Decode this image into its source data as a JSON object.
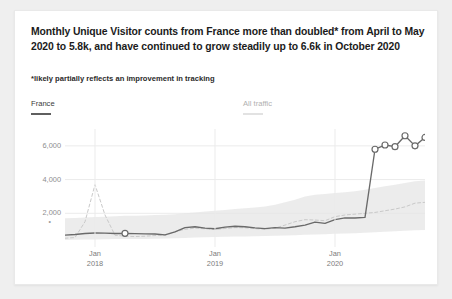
{
  "headline": "Monthly Unique Visitor counts from France more than doubled* from April to May 2020 to 5.8k, and have continued to grow steadily up to 6.6k in October 2020",
  "footnote": "*likely partially reflects an improvement in tracking",
  "legend": {
    "france": "France",
    "all_traffic": "All traffic"
  },
  "colors": {
    "france_line": "#6a6a6a",
    "all_traffic_line": "#c9c9c9",
    "band": "#e6e6e6",
    "grid": "#ebebeb",
    "marker_fill": "#ffffff",
    "card": "#ffffff",
    "page": "#efefef"
  },
  "chart_data": {
    "type": "line",
    "title": "",
    "xlabel": "",
    "ylabel": "",
    "ylim": [
      0,
      7000
    ],
    "grid": true,
    "legend_position": "top",
    "y_ticks": [
      "2,000",
      "4,000",
      "6,000"
    ],
    "y_tick_values": [
      2000,
      4000,
      6000
    ],
    "x_ticks": [
      {
        "month": "Jan",
        "year": "2018"
      },
      {
        "month": "Jan",
        "year": "2019"
      },
      {
        "month": "Jan",
        "year": "2020"
      }
    ],
    "x": [
      "2017-10",
      "2017-11",
      "2017-12",
      "2018-01",
      "2018-02",
      "2018-03",
      "2018-04",
      "2018-05",
      "2018-06",
      "2018-07",
      "2018-08",
      "2018-09",
      "2018-10",
      "2018-11",
      "2018-12",
      "2019-01",
      "2019-02",
      "2019-03",
      "2019-04",
      "2019-05",
      "2019-06",
      "2019-07",
      "2019-08",
      "2019-09",
      "2019-10",
      "2019-11",
      "2019-12",
      "2020-01",
      "2020-02",
      "2020-03",
      "2020-04",
      "2020-05",
      "2020-06",
      "2020-07",
      "2020-08",
      "2020-09",
      "2020-10"
    ],
    "series": [
      {
        "name": "France",
        "style": "solid",
        "values": [
          700,
          740,
          800,
          830,
          820,
          800,
          810,
          790,
          780,
          770,
          720,
          900,
          1150,
          1200,
          1120,
          1080,
          1180,
          1230,
          1200,
          1130,
          1090,
          1150,
          1120,
          1200,
          1300,
          1480,
          1400,
          1620,
          1730,
          1720,
          1760,
          5800,
          6050,
          5950,
          6600,
          6000,
          6500
        ],
        "markers_at": [
          "2018-04",
          "2020-05",
          "2020-06",
          "2020-07",
          "2020-08",
          "2020-09",
          "2020-10"
        ],
        "annotations": [
          {
            "label": "May 2020",
            "value": 5800
          },
          {
            "label": "October 2020",
            "value": 6600
          }
        ]
      },
      {
        "name": "All traffic",
        "style": "dashed",
        "values": [
          520,
          560,
          1500,
          3700,
          1900,
          700,
          640,
          620,
          640,
          680,
          700,
          900,
          1050,
          1120,
          1080,
          1040,
          1100,
          1150,
          1140,
          1090,
          1060,
          1120,
          1300,
          1500,
          1620,
          1600,
          1560,
          1800,
          1900,
          1950,
          2000,
          2050,
          2150,
          2250,
          2380,
          2600,
          2650
        ],
        "band": {
          "name": "range band",
          "upper": [
            1700,
            1720,
            1750,
            1780,
            1800,
            1820,
            1850,
            1860,
            1870,
            1900,
            1920,
            1950,
            2000,
            2050,
            2100,
            2150,
            2200,
            2250,
            2300,
            2350,
            2400,
            2500,
            2650,
            2800,
            3000,
            3100,
            3150,
            3200,
            3250,
            3300,
            3400,
            3500,
            3600,
            3700,
            3800,
            3900,
            3950
          ],
          "lower": [
            420,
            430,
            440,
            450,
            460,
            470,
            470,
            480,
            480,
            490,
            500,
            520,
            540,
            560,
            580,
            600,
            610,
            620,
            630,
            640,
            650,
            660,
            680,
            700,
            720,
            740,
            760,
            780,
            800,
            820,
            850,
            880,
            900,
            930,
            960,
            990,
            1010
          ]
        }
      }
    ]
  }
}
